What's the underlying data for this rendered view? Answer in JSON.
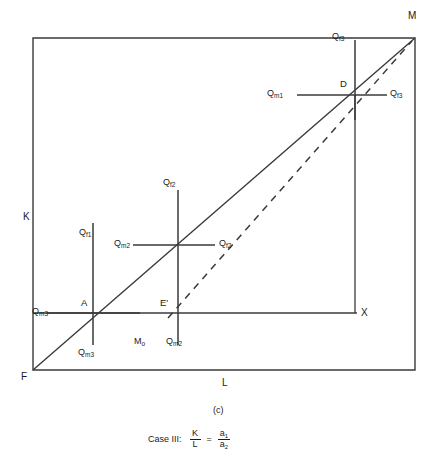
{
  "figure": {
    "label": "(c)",
    "case_text": "Case III:",
    "equation": {
      "numerator_left": "K",
      "denominator_left": "L",
      "equals": "=",
      "numerator_right": "a",
      "numerator_right_sub": "1",
      "denominator_right": "a",
      "denominator_right_sub": "2"
    }
  },
  "axes": {
    "vertical_label": "K",
    "horizontal_label": "L",
    "origin_label": "F",
    "top_right_label": "M",
    "right_label": "X"
  },
  "points": [
    {
      "name": "point-a",
      "label": "A"
    },
    {
      "name": "point-d",
      "label": "D"
    },
    {
      "name": "point-e-prime",
      "label": "E'"
    },
    {
      "name": "point-m-zero",
      "label": "M",
      "sub": "o"
    }
  ],
  "isoquants": {
    "cross_left": {
      "top": {
        "q": "Q",
        "sub": "f",
        "sub2": "1"
      },
      "left": {
        "q": "Q",
        "sub": "m",
        "sub2": "3"
      },
      "bottom": {
        "q": "Q",
        "sub": "m",
        "sub2": "3"
      }
    },
    "cross_middle": {
      "top": {
        "q": "Q",
        "sub": "f",
        "sub2": "2"
      },
      "left": {
        "q": "Q",
        "sub": "m",
        "sub2": "2"
      },
      "right": {
        "q": "Q",
        "sub": "f",
        "sub2": "2"
      }
    },
    "cross_right": {
      "top": {
        "q": "Q",
        "sub": "f",
        "sub2": "3"
      },
      "left": {
        "q": "Q",
        "sub": "m",
        "sub2": "1"
      },
      "right": {
        "q": "Q",
        "sub": "f",
        "sub2": "3"
      }
    },
    "cross_e_prime": {
      "bottom": {
        "q": "Q",
        "sub": "m",
        "sub2": "2"
      }
    }
  },
  "colors": {
    "line": "#3a3a3a",
    "text": "#1a1a1a",
    "background": "#ffffff"
  }
}
